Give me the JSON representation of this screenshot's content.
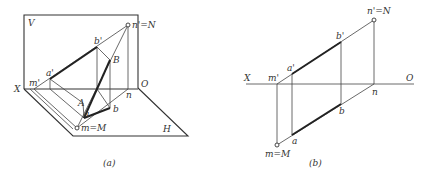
{
  "figures": [
    {
      "id": "a",
      "caption": "(a)",
      "labels": {
        "V": "V",
        "H": "H",
        "X": "X",
        "O": "O",
        "n_prime_N": "n'=N",
        "b_prime": "b'",
        "B": "B",
        "a_prime": "a'",
        "m_prime": "m'",
        "A": "A",
        "a": "a",
        "b": "b",
        "n": "n",
        "m_M": "m=M"
      }
    },
    {
      "id": "b",
      "caption": "(b)",
      "labels": {
        "X": "X",
        "O": "O",
        "n_prime_N": "n'=N",
        "b_prime": "b'",
        "a_prime": "a'",
        "m_prime": "m'",
        "n": "n",
        "b": "b",
        "a": "a",
        "m_M": "m=M"
      }
    }
  ],
  "colors": {
    "line": "#444444",
    "thick_line": "#222222",
    "text": "#333333",
    "background": "#ffffff"
  }
}
